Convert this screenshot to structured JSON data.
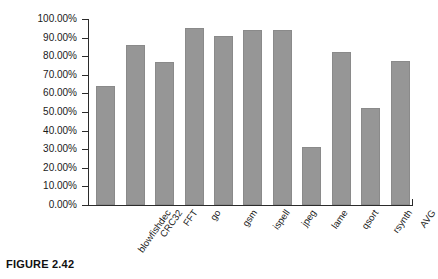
{
  "figure": {
    "caption": "FIGURE 2.42"
  },
  "chart_data": {
    "type": "bar",
    "title": "",
    "xlabel": "",
    "ylabel": "",
    "ylim": [
      0,
      1.0
    ],
    "grid": false,
    "legend": null,
    "bar_color": "#969696",
    "axis_color": "#2b2b2b",
    "categories": [
      "blowfishdec",
      "CRC32",
      "FFT",
      "go",
      "gsm",
      "ispell",
      "jpeg",
      "lame",
      "qsort",
      "rsynth",
      "AVG"
    ],
    "values": [
      0.64,
      0.86,
      0.77,
      0.95,
      0.91,
      0.94,
      0.94,
      0.31,
      0.82,
      0.52,
      0.775
    ],
    "value_labels": [
      "64.00%",
      "86.00%",
      "77.00%",
      "95.00%",
      "91.00%",
      "94.00%",
      "94.00%",
      "31.00%",
      "82.00%",
      "52.00%",
      "77.50%"
    ],
    "yticks": [
      0.0,
      0.1,
      0.2,
      0.3,
      0.4,
      0.5,
      0.6,
      0.7,
      0.8,
      0.9,
      1.0
    ],
    "ytick_labels": [
      "0.00%",
      "10.00%",
      "20.00%",
      "30.00%",
      "40.00%",
      "50.00%",
      "60.00%",
      "70.00%",
      "80.00%",
      "90.00%",
      "100.00%"
    ]
  }
}
